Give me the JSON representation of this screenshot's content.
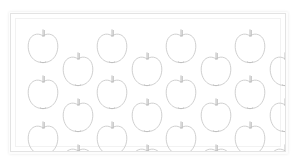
{
  "scene": {
    "title": "Apple outline pattern sheet",
    "background_color": "#ffffff",
    "object_name": "apple",
    "object_count": 24,
    "rendering_style": "light line drawing outline",
    "arrangement": "staggered quincunx grid"
  },
  "panel": {
    "name": "framed panel",
    "x": 10,
    "y": 13,
    "width": 276,
    "height": 139,
    "background_color": "#ffffff",
    "border_color": "#e3e3e3",
    "inner_rule_color": "#f2f2f2"
  },
  "apple_style": {
    "outline_color": "#c9c9c9",
    "stem_color": "#b8b8b8",
    "calyx_color": "#bdbdbd",
    "stroke_width": 0.9,
    "width": 34,
    "height": 38
  },
  "apples": [
    {
      "id": 1,
      "row": 1,
      "col": 1,
      "cx": 32,
      "cy": 33
    },
    {
      "id": 2,
      "row": 1,
      "col": 2,
      "cx": 101,
      "cy": 33
    },
    {
      "id": 3,
      "row": 1,
      "col": 3,
      "cx": 170,
      "cy": 33
    },
    {
      "id": 4,
      "row": 1,
      "col": 4,
      "cx": 239,
      "cy": 33
    },
    {
      "id": 5,
      "row": 2,
      "col": 1,
      "cx": 67,
      "cy": 56
    },
    {
      "id": 6,
      "row": 2,
      "col": 2,
      "cx": 136,
      "cy": 56
    },
    {
      "id": 7,
      "row": 2,
      "col": 3,
      "cx": 205,
      "cy": 56
    },
    {
      "id": 8,
      "row": 2,
      "col": 4,
      "cx": 274,
      "cy": 56
    },
    {
      "id": 9,
      "row": 3,
      "col": 1,
      "cx": 32,
      "cy": 79
    },
    {
      "id": 10,
      "row": 3,
      "col": 2,
      "cx": 101,
      "cy": 79
    },
    {
      "id": 11,
      "row": 3,
      "col": 3,
      "cx": 170,
      "cy": 79
    },
    {
      "id": 12,
      "row": 3,
      "col": 4,
      "cx": 239,
      "cy": 79
    },
    {
      "id": 13,
      "row": 4,
      "col": 1,
      "cx": 67,
      "cy": 102
    },
    {
      "id": 14,
      "row": 4,
      "col": 2,
      "cx": 136,
      "cy": 102
    },
    {
      "id": 15,
      "row": 4,
      "col": 3,
      "cx": 205,
      "cy": 102
    },
    {
      "id": 16,
      "row": 4,
      "col": 4,
      "cx": 274,
      "cy": 102
    },
    {
      "id": 17,
      "row": 5,
      "col": 1,
      "cx": 32,
      "cy": 125
    },
    {
      "id": 18,
      "row": 5,
      "col": 2,
      "cx": 101,
      "cy": 125
    },
    {
      "id": 19,
      "row": 5,
      "col": 3,
      "cx": 170,
      "cy": 125
    },
    {
      "id": 20,
      "row": 5,
      "col": 4,
      "cx": 239,
      "cy": 125
    },
    {
      "id": 21,
      "row": 6,
      "col": 1,
      "cx": 67,
      "cy": 148
    },
    {
      "id": 22,
      "row": 6,
      "col": 2,
      "cx": 136,
      "cy": 148
    },
    {
      "id": 23,
      "row": 6,
      "col": 3,
      "cx": 205,
      "cy": 148
    },
    {
      "id": 24,
      "row": 6,
      "col": 4,
      "cx": 274,
      "cy": 148
    }
  ]
}
